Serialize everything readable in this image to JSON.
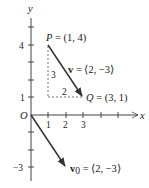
{
  "diagram": {
    "type": "vector-plot",
    "axes": {
      "x_label": "x",
      "y_label": "y",
      "origin_label": "O",
      "x_ticks": [
        "1",
        "2",
        "3"
      ],
      "y_ticks": [
        "4",
        "1",
        "-3"
      ],
      "y_tick_labels_display": {
        "pos4": "4",
        "pos1": "1",
        "neg3": "−3"
      }
    },
    "points": {
      "P": {
        "label": "P = (1, 4)",
        "x": 1,
        "y": 4
      },
      "Q": {
        "label": "Q = (3, 1)",
        "x": 3,
        "y": 1
      }
    },
    "vectors": {
      "v": {
        "name": "v",
        "label_rest": " = ⟨2, −3⟩",
        "from": [
          1,
          4
        ],
        "to": [
          3,
          1
        ]
      },
      "v0": {
        "name": "v",
        "subscript": "0",
        "label_rest": " = ⟨2, −3⟩",
        "from": [
          0,
          0
        ],
        "to": [
          2,
          -3
        ]
      }
    },
    "components": {
      "vertical": "3",
      "horizontal": "2"
    },
    "colors": {
      "axis": "#444444",
      "vector": "#333333",
      "dashed": "#555555"
    }
  }
}
